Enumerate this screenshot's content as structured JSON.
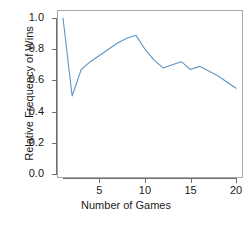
{
  "chart_data": {
    "type": "line",
    "title": "",
    "xlabel": "Number of Games",
    "ylabel": "Relative Frequency of Wins",
    "x": [
      1,
      2,
      3,
      4,
      5,
      6,
      7,
      8,
      9,
      10,
      11,
      12,
      13,
      14,
      15,
      16,
      17,
      18,
      19,
      20
    ],
    "values": [
      1.0,
      0.5,
      0.67,
      0.72,
      0.76,
      0.8,
      0.84,
      0.87,
      0.89,
      0.8,
      0.73,
      0.68,
      0.7,
      0.72,
      0.67,
      0.69,
      0.66,
      0.63,
      0.59,
      0.55
    ],
    "series": [
      {
        "name": "Relative Frequency of Wins",
        "color": "#6095c4",
        "values": [
          1.0,
          0.5,
          0.67,
          0.72,
          0.76,
          0.8,
          0.84,
          0.87,
          0.89,
          0.8,
          0.73,
          0.68,
          0.7,
          0.72,
          0.67,
          0.69,
          0.66,
          0.63,
          0.59,
          0.55
        ]
      }
    ],
    "xlim": [
      1,
      20
    ],
    "ylim": [
      0.0,
      1.0
    ],
    "xticks": [
      5,
      10,
      15,
      20
    ],
    "xtick_labels": [
      "5",
      "10",
      "15",
      "20"
    ],
    "yticks": [
      0.0,
      0.2,
      0.4,
      0.6,
      0.8,
      1.0
    ],
    "ytick_labels": [
      "0.0",
      "0.2",
      "0.4",
      "0.6",
      "0.8",
      "1.0"
    ],
    "grid": false,
    "legend": false,
    "frame": true,
    "line_color": "#6095c4",
    "axis_color": "#6e6e6e",
    "frame_color": "#a8a8a8",
    "text_color": "#1a1a1a",
    "background": "#ffffff"
  }
}
